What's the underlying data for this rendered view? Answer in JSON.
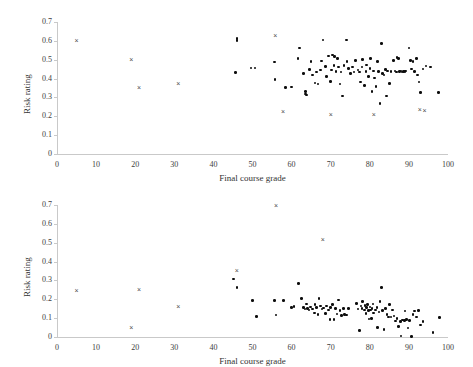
{
  "chart_data": [
    {
      "id": "top",
      "type": "scatter",
      "title": "",
      "xlabel": "Final course grade",
      "ylabel": "Risk rating",
      "xlim": [
        0,
        100
      ],
      "ylim": [
        0,
        0.7
      ],
      "xticks": [
        0,
        10,
        20,
        30,
        40,
        50,
        60,
        70,
        80,
        90,
        100
      ],
      "yticks": [
        "0",
        "0.1",
        "0.2",
        "0.3",
        "0.4",
        "0.5",
        "0.6",
        "0.7"
      ],
      "ytick_values": [
        0,
        0.1,
        0.2,
        0.3,
        0.4,
        0.5,
        0.6,
        0.7
      ],
      "grid": false,
      "legend": "none",
      "series": [
        {
          "name": "dots",
          "marker": "filled-circle",
          "color": "#0d0d0d",
          "points": [
            [
              45.6,
              0.432
            ],
            [
              46.0,
              0.612
            ],
            [
              46.0,
              0.602
            ],
            [
              49.6,
              0.455
            ],
            [
              50.6,
              0.455
            ],
            [
              55.6,
              0.488
            ],
            [
              55.8,
              0.396
            ],
            [
              58.4,
              0.354
            ],
            [
              60.0,
              0.355
            ],
            [
              61.6,
              0.505
            ],
            [
              62.0,
              0.563
            ],
            [
              63.0,
              0.428
            ],
            [
              63.6,
              0.318
            ],
            [
              63.6,
              0.332
            ],
            [
              63.8,
              0.313
            ],
            [
              64.6,
              0.447
            ],
            [
              65.0,
              0.492
            ],
            [
              65.4,
              0.418
            ],
            [
              66.0,
              0.376
            ],
            [
              66.4,
              0.434
            ],
            [
              66.8,
              0.372
            ],
            [
              67.4,
              0.445
            ],
            [
              67.6,
              0.493
            ],
            [
              68.0,
              0.605
            ],
            [
              68.6,
              0.463
            ],
            [
              69.0,
              0.41
            ],
            [
              69.4,
              0.52
            ],
            [
              70.0,
              0.386
            ],
            [
              70.2,
              0.445
            ],
            [
              70.4,
              0.524
            ],
            [
              70.8,
              0.47
            ],
            [
              71.0,
              0.516
            ],
            [
              71.4,
              0.436
            ],
            [
              71.8,
              0.508
            ],
            [
              72.0,
              0.462
            ],
            [
              72.4,
              0.372
            ],
            [
              72.6,
              0.435
            ],
            [
              73.0,
              0.307
            ],
            [
              73.4,
              0.468
            ],
            [
              74.0,
              0.605
            ],
            [
              74.2,
              0.49
            ],
            [
              74.6,
              0.452
            ],
            [
              75.0,
              0.428
            ],
            [
              75.6,
              0.462
            ],
            [
              76.0,
              0.435
            ],
            [
              76.4,
              0.497
            ],
            [
              77.0,
              0.446
            ],
            [
              77.4,
              0.435
            ],
            [
              77.6,
              0.382
            ],
            [
              78.0,
              0.462
            ],
            [
              78.2,
              0.5
            ],
            [
              78.6,
              0.363
            ],
            [
              79.0,
              0.436
            ],
            [
              79.2,
              0.472
            ],
            [
              79.6,
              0.412
            ],
            [
              80.0,
              0.452
            ],
            [
              80.2,
              0.505
            ],
            [
              80.6,
              0.33
            ],
            [
              81.0,
              0.44
            ],
            [
              81.2,
              0.403
            ],
            [
              81.6,
              0.357
            ],
            [
              82.0,
              0.49
            ],
            [
              82.2,
              0.437
            ],
            [
              82.6,
              0.267
            ],
            [
              83.0,
              0.585
            ],
            [
              83.2,
              0.428
            ],
            [
              83.6,
              0.418
            ],
            [
              84.0,
              0.448
            ],
            [
              84.2,
              0.308
            ],
            [
              84.6,
              0.44
            ],
            [
              85.0,
              0.373
            ],
            [
              85.4,
              0.436
            ],
            [
              86.0,
              0.497
            ],
            [
              86.4,
              0.44
            ],
            [
              86.8,
              0.435
            ],
            [
              87.0,
              0.513
            ],
            [
              87.4,
              0.508
            ],
            [
              87.6,
              0.437
            ],
            [
              88.0,
              0.44
            ],
            [
              88.2,
              0.435
            ],
            [
              88.6,
              0.436
            ],
            [
              89.0,
              0.437
            ],
            [
              89.2,
              0.44
            ],
            [
              90.0,
              0.563
            ],
            [
              90.4,
              0.497
            ],
            [
              90.6,
              0.45
            ],
            [
              91.0,
              0.492
            ],
            [
              91.4,
              0.438
            ],
            [
              92.0,
              0.505
            ],
            [
              92.2,
              0.418
            ],
            [
              92.6,
              0.382
            ],
            [
              93.0,
              0.325
            ],
            [
              93.6,
              0.45
            ],
            [
              94.4,
              0.466
            ],
            [
              95.6,
              0.462
            ],
            [
              97.6,
              0.325
            ]
          ]
        },
        {
          "name": "x-markers",
          "marker": "cross",
          "color": "#4d4d4d",
          "points": [
            [
              5.0,
              0.602
            ],
            [
              19.0,
              0.502
            ],
            [
              21.0,
              0.355
            ],
            [
              31.0,
              0.375
            ],
            [
              55.8,
              0.63
            ],
            [
              57.8,
              0.228
            ],
            [
              70.0,
              0.21
            ],
            [
              81.0,
              0.21
            ],
            [
              92.8,
              0.235
            ],
            [
              94.0,
              0.232
            ]
          ]
        }
      ]
    },
    {
      "id": "bottom",
      "type": "scatter",
      "title": "",
      "xlabel": "Final course grade",
      "ylabel": "Risk rating",
      "xlim": [
        0,
        100
      ],
      "ylim": [
        0,
        0.7
      ],
      "xticks": [
        0,
        10,
        20,
        30,
        40,
        50,
        60,
        70,
        80,
        90,
        100
      ],
      "yticks": [
        "0",
        "0.1",
        "0.2",
        "0.3",
        "0.4",
        "0.5",
        "0.6",
        "0.7"
      ],
      "ytick_values": [
        0,
        0.1,
        0.2,
        0.3,
        0.4,
        0.5,
        0.6,
        0.7
      ],
      "grid": false,
      "legend": "none",
      "series": [
        {
          "name": "dots",
          "marker": "filled-circle",
          "color": "#0d0d0d",
          "points": [
            [
              45.2,
              0.307
            ],
            [
              46.0,
              0.262
            ],
            [
              50.0,
              0.195
            ],
            [
              51.0,
              0.108
            ],
            [
              55.6,
              0.195
            ],
            [
              56.0,
              0.117
            ],
            [
              58.0,
              0.195
            ],
            [
              60.0,
              0.158
            ],
            [
              60.6,
              0.162
            ],
            [
              61.8,
              0.285
            ],
            [
              62.6,
              0.205
            ],
            [
              63.0,
              0.155
            ],
            [
              63.4,
              0.148
            ],
            [
              63.8,
              0.175
            ],
            [
              64.0,
              0.152
            ],
            [
              64.4,
              0.143
            ],
            [
              64.8,
              0.16
            ],
            [
              65.4,
              0.148
            ],
            [
              65.8,
              0.128
            ],
            [
              66.0,
              0.173
            ],
            [
              66.4,
              0.155
            ],
            [
              66.8,
              0.118
            ],
            [
              67.0,
              0.203
            ],
            [
              67.4,
              0.165
            ],
            [
              67.8,
              0.148
            ],
            [
              68.2,
              0.153
            ],
            [
              68.6,
              0.125
            ],
            [
              69.0,
              0.165
            ],
            [
              69.4,
              0.143
            ],
            [
              69.8,
              0.092
            ],
            [
              70.0,
              0.155
            ],
            [
              70.4,
              0.173
            ],
            [
              70.8,
              0.093
            ],
            [
              71.2,
              0.152
            ],
            [
              71.6,
              0.123
            ],
            [
              72.0,
              0.196
            ],
            [
              72.4,
              0.142
            ],
            [
              72.8,
              0.115
            ],
            [
              73.2,
              0.152
            ],
            [
              73.6,
              0.118
            ],
            [
              74.0,
              0.116
            ],
            [
              74.6,
              0.152
            ],
            [
              76.6,
              0.178
            ],
            [
              77.0,
              0.148
            ],
            [
              77.4,
              0.035
            ],
            [
              77.8,
              0.165
            ],
            [
              78.0,
              0.152
            ],
            [
              78.2,
              0.187
            ],
            [
              78.6,
              0.143
            ],
            [
              78.8,
              0.168
            ],
            [
              79.0,
              0.125
            ],
            [
              79.2,
              0.155
            ],
            [
              79.4,
              0.172
            ],
            [
              79.6,
              0.14
            ],
            [
              79.8,
              0.095
            ],
            [
              80.0,
              0.16
            ],
            [
              80.2,
              0.143
            ],
            [
              80.4,
              0.098
            ],
            [
              80.6,
              0.152
            ],
            [
              80.8,
              0.175
            ],
            [
              81.0,
              0.128
            ],
            [
              81.4,
              0.143
            ],
            [
              81.8,
              0.157
            ],
            [
              82.0,
              0.05
            ],
            [
              82.4,
              0.133
            ],
            [
              82.6,
              0.187
            ],
            [
              83.0,
              0.262
            ],
            [
              83.2,
              0.142
            ],
            [
              83.6,
              0.04
            ],
            [
              84.0,
              0.152
            ],
            [
              84.4,
              0.118
            ],
            [
              84.8,
              0.107
            ],
            [
              85.0,
              0.172
            ],
            [
              85.4,
              0.105
            ],
            [
              85.8,
              0.143
            ],
            [
              86.2,
              0.112
            ],
            [
              86.6,
              0.085
            ],
            [
              87.0,
              0.098
            ],
            [
              87.4,
              0.055
            ],
            [
              87.8,
              0.082
            ],
            [
              88.0,
              0.005
            ],
            [
              88.4,
              0.09
            ],
            [
              88.8,
              0.088
            ],
            [
              89.0,
              0.137
            ],
            [
              89.4,
              0.092
            ],
            [
              89.8,
              0.048
            ],
            [
              90.2,
              0.088
            ],
            [
              90.6,
              0.003
            ],
            [
              91.0,
              0.118
            ],
            [
              91.4,
              0.138
            ],
            [
              92.0,
              0.105
            ],
            [
              92.4,
              0.142
            ],
            [
              93.0,
              0.063
            ],
            [
              93.6,
              0.082
            ],
            [
              96.2,
              0.023
            ],
            [
              97.8,
              0.102
            ]
          ]
        },
        {
          "name": "x-markers",
          "marker": "cross",
          "color": "#4d4d4d",
          "points": [
            [
              5.0,
              0.245
            ],
            [
              19.0,
              0.05
            ],
            [
              21.0,
              0.25
            ],
            [
              31.0,
              0.16
            ],
            [
              46.0,
              0.355
            ],
            [
              56.0,
              0.695
            ],
            [
              68.0,
              0.515
            ]
          ]
        }
      ]
    }
  ]
}
